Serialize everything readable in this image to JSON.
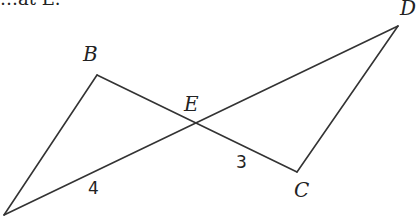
{
  "diagram": {
    "type": "geometry",
    "top_text_partial": "…at E.",
    "points": {
      "A": {
        "x": 4,
        "y": 215,
        "label": ""
      },
      "B": {
        "x": 97,
        "y": 75,
        "label": "B"
      },
      "C": {
        "x": 297,
        "y": 172,
        "label": "C"
      },
      "D": {
        "x": 398,
        "y": 26,
        "label": "D"
      },
      "E": {
        "x": 196,
        "y": 123,
        "label": "E"
      }
    },
    "segments": [
      {
        "from": "A",
        "to": "B"
      },
      {
        "from": "B",
        "to": "C"
      },
      {
        "from": "C",
        "to": "D"
      },
      {
        "from": "A",
        "to": "D"
      }
    ],
    "measure_labels": {
      "AE": "4",
      "EC": "3"
    },
    "line_color": "#333333"
  }
}
